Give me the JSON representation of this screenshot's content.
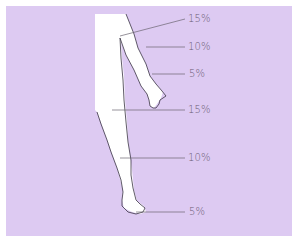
{
  "diagram": {
    "background_color": "#ddcaf2",
    "figure_color": "#ffffff",
    "outline_color": "#3a3444",
    "leader_line_color": "#6a6470",
    "labels": [
      {
        "region": "upper-arm",
        "text": "15%",
        "x": 188,
        "y": 13
      },
      {
        "region": "forearm",
        "text": "10%",
        "x": 188,
        "y": 41
      },
      {
        "region": "hand",
        "text": "5%",
        "x": 189,
        "y": 69
      },
      {
        "region": "thigh",
        "text": "15%",
        "x": 188,
        "y": 107
      },
      {
        "region": "lower-leg",
        "text": "10%",
        "x": 188,
        "y": 153
      },
      {
        "region": "foot",
        "text": "5%",
        "x": 189,
        "y": 208
      }
    ]
  }
}
